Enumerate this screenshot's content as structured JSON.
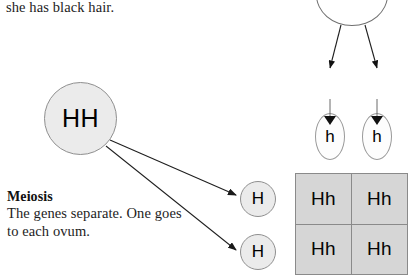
{
  "page": {
    "width": 417,
    "height": 276,
    "background_color": "#ffffff"
  },
  "top_caption": {
    "text": "she has black hair."
  },
  "meiosis_block": {
    "heading": "Meiosis",
    "line1": "The genes separate. One goes",
    "line2": "to each ovum."
  },
  "maternal_side": {
    "parent_genotype_circle": {
      "label": "HH",
      "fill_color": "#ebebeb",
      "stroke_color": "#8f8f8f"
    },
    "ova": [
      {
        "label": "H",
        "fill_color": "#ebebeb",
        "stroke_color": "#8f8f8f"
      },
      {
        "label": "H",
        "fill_color": "#ebebeb",
        "stroke_color": "#8f8f8f"
      }
    ],
    "arrow_count": 2
  },
  "paternal_side": {
    "parent_genotype_circle": {
      "label": "",
      "fill_color": "#ffffff",
      "stroke_color": "#6f6f6f",
      "cropped": "top"
    },
    "sperm": [
      {
        "label": "h",
        "fill_color": "#fdfdfd",
        "stroke_color": "#9a9a9a"
      },
      {
        "label": "h",
        "fill_color": "#fdfdfd",
        "stroke_color": "#9a9a9a"
      }
    ],
    "arrow_count": 2
  },
  "punnett_square": {
    "rows": 2,
    "columns": 2,
    "cell_fill_color": "#d6d6d6",
    "grid_line_color": "#8a8a8a",
    "cells": [
      [
        "Hh",
        "Hh"
      ],
      [
        "Hh",
        "Hh"
      ]
    ]
  }
}
